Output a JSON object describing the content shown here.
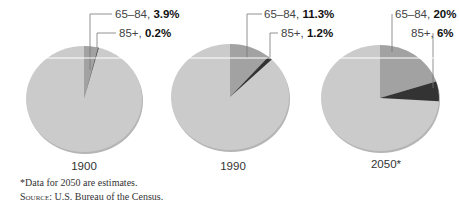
{
  "chart_data": {
    "type": "pie",
    "title": "",
    "charts": [
      {
        "label": "1900",
        "slices": [
          {
            "name": "65–84",
            "value": 3.9
          },
          {
            "name": "85+",
            "value": 0.2
          },
          {
            "name": "Under 65",
            "value": 95.9
          }
        ]
      },
      {
        "label": "1990",
        "slices": [
          {
            "name": "65–84",
            "value": 11.3
          },
          {
            "name": "85+",
            "value": 1.2
          },
          {
            "name": "Under 65",
            "value": 87.5
          }
        ]
      },
      {
        "label": "2050*",
        "slices": [
          {
            "name": "65–84",
            "value": 20
          },
          {
            "name": "85+",
            "value": 6
          },
          {
            "name": "Under 65",
            "value": 74
          }
        ]
      }
    ],
    "colors": {
      "65–84": "#a2a2a2",
      "85+": "#333333",
      "rest": "#cbcbcb"
    }
  },
  "pies": [
    {
      "year": "1900",
      "l1_name": "65–84, ",
      "l1_val": "3.9%",
      "l2_name": "85+, ",
      "l2_val": "0.2%"
    },
    {
      "year": "1990",
      "l1_name": "65–84, ",
      "l1_val": "11.3%",
      "l2_name": "85+, ",
      "l2_val": "1.2%"
    },
    {
      "year": "2050*",
      "l1_name": "65–84, ",
      "l1_val": "20%",
      "l2_name": "85+, ",
      "l2_val": "6%"
    }
  ],
  "footnote": "*Data for 2050 are estimates.",
  "source_label": "Source:",
  "source_text": " U.S. Bureau of the Census."
}
